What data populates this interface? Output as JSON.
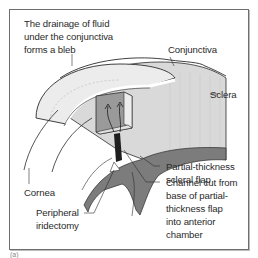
{
  "figure": {
    "caption_label": "(a)",
    "labels": {
      "bleb": [
        "The drainage of fluid",
        "under the conjunctiva",
        "forms a bleb"
      ],
      "conjunctiva": "Conjunctiva",
      "sclera": "Sclera",
      "scleral_flap": [
        "Partial-thickness",
        "scleral flap"
      ],
      "channel": [
        "Channel cut from",
        "base of partial-",
        "thickness flap",
        "into anterior",
        "chamber"
      ],
      "cornea": "Cornea",
      "iridectomy": [
        "Peripheral",
        "iridectomy"
      ]
    },
    "colors": {
      "outline": "#2b2b2b",
      "sclera_fill": "#d9d9d9",
      "bleb_fill": "#ececec",
      "flap_fill": "#9a9a9a",
      "iris_fill": "#7c7c7c",
      "channel_fill": "#1e1e1e"
    }
  }
}
